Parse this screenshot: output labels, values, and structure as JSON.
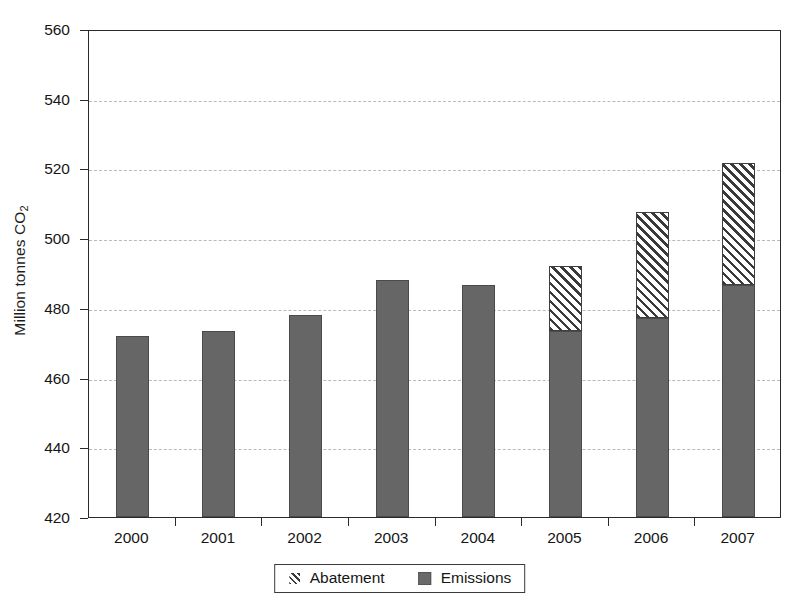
{
  "chart_data": {
    "type": "bar",
    "stacked": true,
    "title": "",
    "subtitle": "",
    "xlabel": "",
    "ylabel": "Million tonnes CO2",
    "ylabel_display": "Million tonnes CO",
    "ylabel_subscript": "2",
    "categories": [
      "2000",
      "2001",
      "2002",
      "2003",
      "2004",
      "2005",
      "2006",
      "2007"
    ],
    "series": [
      {
        "name": "Emissions",
        "pattern": "solid",
        "color": "#666666",
        "values": [
          472,
          473.5,
          478,
          488,
          486.5,
          473.5,
          477,
          486.5
        ]
      },
      {
        "name": "Abatement",
        "pattern": "diagonal-hatch",
        "color": "#3a3a3a",
        "values": [
          0,
          0,
          0,
          0,
          0,
          18.5,
          30.5,
          35
        ]
      }
    ],
    "totals": [
      472,
      473.5,
      478,
      488,
      486.5,
      492,
      507.5,
      521.5
    ],
    "ylim": [
      420,
      560
    ],
    "yticks": [
      420,
      440,
      460,
      480,
      500,
      520,
      540,
      560
    ],
    "ytick_labels": [
      "420",
      "440",
      "460",
      "480",
      "500",
      "520",
      "540",
      "560"
    ],
    "grid": true,
    "grid_style": "dashed",
    "grid_color": "#b9b9b9",
    "legend_position": "bottom-center",
    "legend_entries": [
      {
        "label": "Abatement",
        "swatch": "hatch-swatch-icon"
      },
      {
        "label": "Emissions",
        "swatch": "solid-swatch-icon"
      }
    ],
    "background_color": "#ffffff",
    "axis_color": "#2a2a2a"
  }
}
